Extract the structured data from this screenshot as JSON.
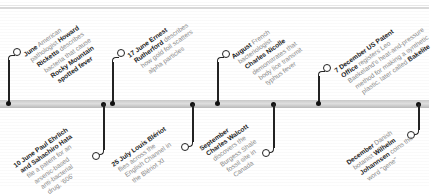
{
  "timeline": {
    "events_above": [
      {
        "date": "June",
        "lines": [
          [
            {
              "t": "June",
              "b": true
            },
            {
              "t": " American",
              "b": false
            }
          ],
          [
            {
              "t": "pathologist ",
              "b": false
            },
            {
              "t": "Howard",
              "b": true
            }
          ],
          [
            {
              "t": "Ricketts",
              "b": true
            },
            {
              "t": " describes",
              "b": false
            }
          ],
          [
            {
              "t": "bacteria that cause",
              "b": false
            }
          ],
          [
            {
              "t": "Rocky Mountain",
              "b": true
            }
          ],
          [
            {
              "t": "spotted fever",
              "b": true
            }
          ]
        ]
      },
      {
        "date": "17 June",
        "lines": [
          [
            {
              "t": "17 June Ernest",
              "b": true
            }
          ],
          [
            {
              "t": "Rutherford",
              "b": true
            },
            {
              "t": " describes",
              "b": false
            }
          ],
          [
            {
              "t": "how gold foil scatters",
              "b": false
            }
          ],
          [
            {
              "t": "alpha particles",
              "b": false
            }
          ]
        ]
      },
      {
        "date": "August",
        "lines": [
          [
            {
              "t": "August",
              "b": true
            },
            {
              "t": " French",
              "b": false
            }
          ],
          [
            {
              "t": "bacteriologist",
              "b": false
            }
          ],
          [
            {
              "t": "Charles Nicolle",
              "b": true
            }
          ],
          [
            {
              "t": "demonstrates that",
              "b": false
            }
          ],
          [
            {
              "t": "body lice transmit",
              "b": false
            }
          ],
          [
            {
              "t": "typhus fever",
              "b": false
            }
          ]
        ]
      },
      {
        "date": "7 December",
        "lines": [
          [
            {
              "t": "7 December US Patent",
              "b": true
            }
          ],
          [
            {
              "t": "Office",
              "b": true
            },
            {
              "t": " registers Leo",
              "b": false
            }
          ],
          [
            {
              "t": "Baekeland's heat-and-pressure",
              "b": false
            }
          ],
          [
            {
              "t": "method for making a synthetic",
              "b": false
            }
          ],
          [
            {
              "t": "plastic, later called ",
              "b": false
            },
            {
              "t": "Bakelite",
              "b": true
            }
          ]
        ]
      }
    ],
    "events_below": [
      {
        "date": "10 June",
        "lines": [
          [
            {
              "t": "10 June Paul Ehrlich",
              "b": true
            }
          ],
          [
            {
              "t": "and Sahachiro Hata",
              "b": true
            }
          ],
          [
            {
              "t": "file a patent for an",
              "b": false
            }
          ],
          [
            {
              "t": "arsenic-based",
              "b": false
            }
          ],
          [
            {
              "t": "anti-bacterial",
              "b": false
            }
          ],
          [
            {
              "t": "drug, '606'",
              "b": false
            }
          ]
        ]
      },
      {
        "date": "25 July",
        "lines": [
          [
            {
              "t": "25 July Louis Blériot",
              "b": true
            }
          ],
          [
            {
              "t": "flies across the",
              "b": false
            }
          ],
          [
            {
              "t": "English Channel in",
              "b": false
            }
          ],
          [
            {
              "t": "the Blériot XI",
              "b": false
            }
          ]
        ]
      },
      {
        "date": "September",
        "lines": [
          [
            {
              "t": "September",
              "b": true
            }
          ],
          [
            {
              "t": "Charles Walcott",
              "b": true
            }
          ],
          [
            {
              "t": "discovers the",
              "b": false
            }
          ],
          [
            {
              "t": "Burgess Shale",
              "b": false
            }
          ],
          [
            {
              "t": "fossil site in",
              "b": false
            }
          ],
          [
            {
              "t": "Canada",
              "b": false
            }
          ]
        ]
      },
      {
        "date": "December",
        "lines": [
          [
            {
              "t": "December",
              "b": true
            },
            {
              "t": " Danish",
              "b": false
            }
          ],
          [
            {
              "t": "botanist ",
              "b": false
            },
            {
              "t": "Wilhelm",
              "b": true
            }
          ],
          [
            {
              "t": "Johannsen",
              "b": true
            },
            {
              "t": " coins the",
              "b": false
            }
          ],
          [
            {
              "t": "word \"gene\"",
              "b": false
            }
          ]
        ]
      }
    ],
    "colors": {
      "text_bold": "#222222",
      "text_regular": "#8a8a8a",
      "band": "#c9c9c9",
      "connector": "#222222"
    }
  }
}
